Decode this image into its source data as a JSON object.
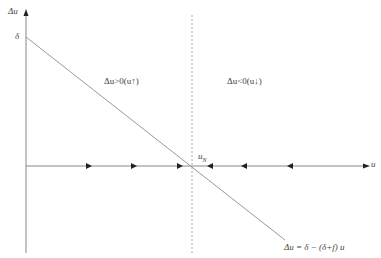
{
  "diagram": {
    "axes": {
      "y_label": "Δu",
      "x_label": "u"
    },
    "intercept_label": "δ",
    "equilibrium_label": {
      "base": "u",
      "sub": "N"
    },
    "regions": {
      "left": "Δu>0(u↑)",
      "right": "Δu<0(u↓)"
    },
    "line_equation": "Δu = δ − (δ+f) u",
    "arrows": {
      "left_direction": "right",
      "left_positions": [
        89,
        134,
        180
      ],
      "right_direction": "left",
      "right_positions": [
        210,
        244,
        290
      ]
    },
    "colors": {
      "line": "#999999",
      "axis": "#888888",
      "arrow": "#222222",
      "dashed": "#aaaaaa"
    }
  }
}
